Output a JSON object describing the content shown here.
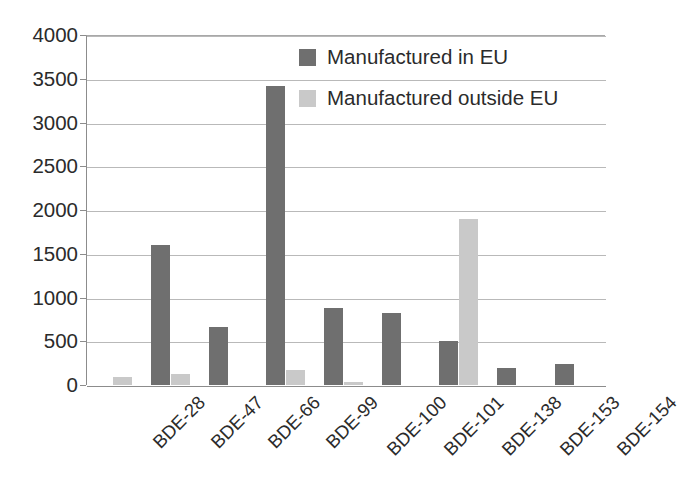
{
  "chart_data": {
    "type": "bar",
    "title": "",
    "subtitle": "",
    "xlabel": "",
    "ylabel": "",
    "ylim": [
      0,
      4000
    ],
    "ytick_step": 500,
    "yticks": [
      "4000",
      "3500",
      "3000",
      "2500",
      "2000",
      "1500",
      "1000",
      "500",
      "0"
    ],
    "grid": true,
    "grid_axis": "y",
    "legend_position": "inside-top-right",
    "categories": [
      "BDE-28",
      "BDE-47",
      "BDE-66",
      "BDE-99",
      "BDE-100",
      "BDE-101",
      "BDE-138",
      "BDE-153",
      "BDE-154"
    ],
    "series": [
      {
        "name": "Manufactured in EU",
        "color": "#6f6f6f",
        "values": [
          0,
          1600,
          660,
          3420,
          880,
          820,
          500,
          200,
          235
        ]
      },
      {
        "name": "Manufactured outside EU",
        "color": "#c9c9c9",
        "values": [
          90,
          130,
          0,
          170,
          40,
          0,
          1900,
          0,
          0
        ]
      }
    ]
  },
  "legend": {
    "entries": [
      {
        "label": "Manufactured in EU",
        "swatch": "series-eu"
      },
      {
        "label": "Manufactured outside EU",
        "swatch": "series-noneu"
      }
    ]
  },
  "colors": {
    "series_eu": "#6f6f6f",
    "series_non_eu": "#c9c9c9",
    "gridline": "#b9b9b9",
    "axis": "#8c8c8c",
    "text": "#2b2b2b",
    "background": "#ffffff"
  }
}
